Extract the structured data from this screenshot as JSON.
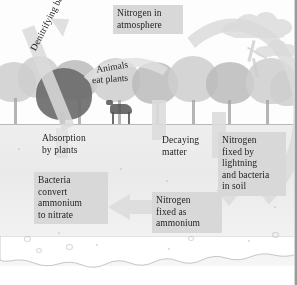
{
  "figure": {
    "type": "nitrogen-cycle-diagram",
    "medium": "grayscale textbook illustration",
    "title_visible": false
  },
  "labels": {
    "atmosphere": "Nitrogen in\natmosphere",
    "denitrifying": "Denitrifying bacteria",
    "animals_line1": "Animals",
    "animals_line2": "eat plants",
    "absorption": "Absorption\nby plants",
    "decaying": "Decaying\nmatter",
    "lightning": "Nitrogen\nfixed by\nlightning\nand bacteria\nin soil",
    "ammonium": "Nitrogen\nfixed as\nammonium",
    "bacteria": "Bacteria\nconvert\nammonium\nto nitrate"
  },
  "colors": {
    "label_box": "#d9d8d5",
    "arrow": "#dcdbd8",
    "soil": "#eceae7",
    "text": "#23232b",
    "tree_dark": "#6f6d68",
    "tree_light": "#cfcecb"
  },
  "scene_elements": {
    "cloud": "cloud-icon",
    "lightning_bolt": "lightning-bolt-icon",
    "grazing_animal": "deer-icon",
    "ground_line": "soil-surface-line"
  }
}
